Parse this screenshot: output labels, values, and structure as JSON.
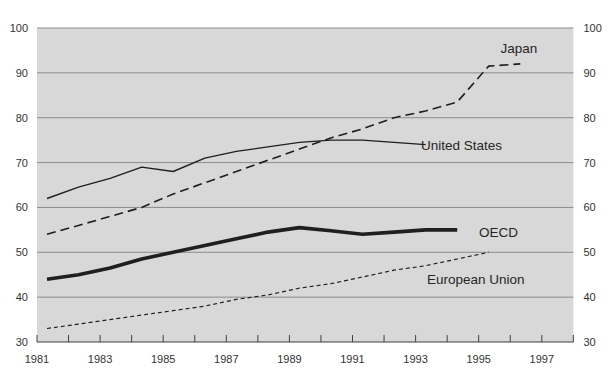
{
  "chart_data": {
    "type": "line",
    "title": "",
    "x_axis": {
      "start_year": 1981,
      "end_year": 1998,
      "tick_step_years": 1,
      "labeled_years": [
        1981,
        1983,
        1985,
        1987,
        1989,
        1991,
        1993,
        1995,
        1997
      ],
      "tick_labels": [
        "1981",
        "1983",
        "1985",
        "1987",
        "1989",
        "1991",
        "1993",
        "1995",
        "1997"
      ]
    },
    "y_axis": {
      "min": 30,
      "max": 100,
      "step": 10,
      "tick_labels": [
        "30",
        "40",
        "50",
        "60",
        "70",
        "80",
        "90",
        "100"
      ],
      "label_sides": "both",
      "grid": "on"
    },
    "colors": {
      "plot_background": "#d8d8d8",
      "gridline": "#8c8c8c",
      "axis_line": "#404040",
      "line_color": "#1f1f1f",
      "text_color": "#333333"
    },
    "series": [
      {
        "name": "Japan",
        "line_style": "dashed",
        "years": [
          1981,
          1982,
          1983,
          1984,
          1985,
          1986,
          1987,
          1988,
          1989,
          1990,
          1991,
          1992,
          1993,
          1994,
          1995,
          1996
        ],
        "values": [
          54,
          56,
          58,
          60,
          63,
          65.5,
          68,
          70.5,
          73,
          75.5,
          77.5,
          80,
          81.5,
          83.5,
          91.5,
          92
        ]
      },
      {
        "name": "United States",
        "line_style": "solid-thin",
        "years": [
          1981,
          1982,
          1983,
          1984,
          1985,
          1986,
          1987,
          1988,
          1989,
          1990,
          1991,
          1992,
          1993
        ],
        "values": [
          62,
          64.5,
          66.5,
          69,
          68,
          71,
          72.5,
          73.5,
          74.5,
          75,
          75,
          74.5,
          74
        ]
      },
      {
        "name": "OECD",
        "line_style": "solid-thick",
        "years": [
          1981,
          1982,
          1983,
          1984,
          1985,
          1986,
          1987,
          1988,
          1989,
          1990,
          1991,
          1992,
          1993,
          1994
        ],
        "values": [
          44,
          45,
          46.5,
          48.5,
          50,
          51.5,
          53,
          54.5,
          55.5,
          54.8,
          54,
          54.5,
          55,
          55
        ]
      },
      {
        "name": "European Union",
        "line_style": "fine-dashed",
        "years": [
          1981,
          1982,
          1983,
          1984,
          1985,
          1986,
          1987,
          1988,
          1989,
          1990,
          1991,
          1992,
          1993,
          1994,
          1995
        ],
        "values": [
          33,
          34,
          35,
          36,
          37,
          38,
          39.5,
          40.5,
          42,
          43,
          44.5,
          46,
          47,
          48.5,
          50
        ]
      }
    ]
  }
}
